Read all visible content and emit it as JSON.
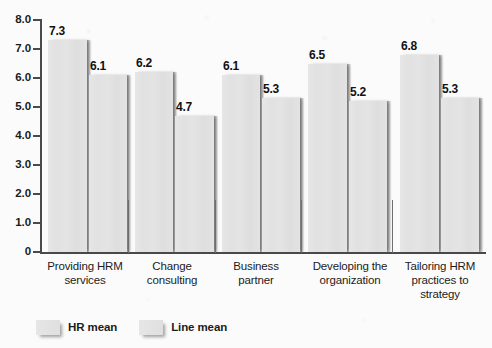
{
  "chart_data": {
    "type": "bar",
    "title": "",
    "xlabel": "",
    "ylabel": "",
    "ylim": [
      0,
      8.0
    ],
    "ytick_labels": [
      "0",
      "1.0",
      "2.0",
      "3.0",
      "4.0",
      "5.0",
      "6.0",
      "7.0",
      "8.0"
    ],
    "ytick_values": [
      0,
      1,
      2,
      3,
      4,
      5,
      6,
      7,
      8
    ],
    "grid": false,
    "legend_position": "bottom-left",
    "categories": [
      "Providing HRM services",
      "Change consulting",
      "Business partner",
      "Developing the organization",
      "Tailoring HRM practices to strategy"
    ],
    "category_lines": [
      [
        "Providing HRM",
        "services"
      ],
      [
        "Change",
        "consulting"
      ],
      [
        "Business",
        "partner"
      ],
      [
        "Developing the",
        "organization"
      ],
      [
        "Tailoring HRM",
        "practices to",
        "strategy"
      ]
    ],
    "series": [
      {
        "name": "HR mean",
        "values": [
          7.3,
          6.2,
          6.1,
          6.5,
          6.8
        ],
        "labels": [
          "7.3",
          "6.2",
          "6.1",
          "6.5",
          "6.8"
        ],
        "color": "#e2e2e2"
      },
      {
        "name": "Line mean",
        "values": [
          6.1,
          4.7,
          5.3,
          5.2,
          5.3
        ],
        "labels": [
          "6.1",
          "4.7",
          "5.3",
          "5.2",
          "5.3"
        ],
        "color": "#e2e2e2"
      }
    ]
  },
  "legend": {
    "items": [
      {
        "label": "HR mean"
      },
      {
        "label": "Line mean"
      }
    ]
  },
  "colors": {
    "background": "#fbfbfb",
    "axis": "#4a4a4a",
    "bar_fill": "#e2e2e2",
    "bar_shadow": "#5a5a5a",
    "text": "#1c1c1c"
  }
}
